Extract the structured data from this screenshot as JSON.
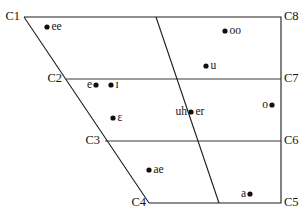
{
  "figure": {
    "name": "vowel-quadrilateral-diagram",
    "type": "diagram",
    "background_color": "#ffffff",
    "line_color": "#1c1c1c",
    "divider_color": "#3a3a3a",
    "dot_color": "#101010"
  },
  "corners": [
    {
      "id": "C1",
      "label": "C1",
      "x": 20,
      "y": 17,
      "anchor": "right"
    },
    {
      "id": "C8",
      "label": "C8",
      "x": 284,
      "y": 17,
      "anchor": "left"
    },
    {
      "id": "C2",
      "label": "C2",
      "x": 62,
      "y": 79,
      "anchor": "right"
    },
    {
      "id": "C7",
      "label": "C7",
      "x": 284,
      "y": 79,
      "anchor": "left"
    },
    {
      "id": "C3",
      "label": "C3",
      "x": 100,
      "y": 141,
      "anchor": "right"
    },
    {
      "id": "C6",
      "label": "C6",
      "x": 284,
      "y": 141,
      "anchor": "left"
    },
    {
      "id": "C4",
      "label": "C4",
      "x": 146,
      "y": 203,
      "anchor": "right"
    },
    {
      "id": "C5",
      "label": "C5",
      "x": 284,
      "y": 203,
      "anchor": "left"
    }
  ],
  "vowels": [
    {
      "label": "ee",
      "dot_x": 47,
      "dot_y": 27,
      "label_side": "right"
    },
    {
      "label": "oo",
      "dot_x": 225,
      "dot_y": 31,
      "label_side": "right"
    },
    {
      "label": "u",
      "dot_x": 206,
      "dot_y": 66,
      "label_side": "right"
    },
    {
      "label": "e",
      "dot_x": 96,
      "dot_y": 85,
      "label_side": "left"
    },
    {
      "label": "ɪ",
      "dot_x": 111,
      "dot_y": 85,
      "label_side": "right"
    },
    {
      "label": "o",
      "dot_x": 272,
      "dot_y": 105,
      "label_side": "left"
    },
    {
      "label": "uh",
      "dot_x": 191,
      "dot_y": 112,
      "label_side": "left"
    },
    {
      "label": "er",
      "dot_x": 191,
      "dot_y": 112,
      "label_side": "right"
    },
    {
      "label": "ɛ",
      "dot_x": 113,
      "dot_y": 118,
      "label_side": "right"
    },
    {
      "label": "ae",
      "dot_x": 149,
      "dot_y": 170,
      "label_side": "right"
    },
    {
      "label": "a",
      "dot_x": 250,
      "dot_y": 194,
      "label_side": "left"
    }
  ],
  "geometry": {
    "outline_points": "24,17 281,17 281,203 149,203",
    "divider_lines": [
      {
        "name": "line-c2-c7",
        "x1": 66,
        "y1": 79,
        "x2": 281,
        "y2": 79
      },
      {
        "name": "line-c3-c6",
        "x1": 105,
        "y1": 141,
        "x2": 281,
        "y2": 141
      }
    ],
    "diagonal_line": {
      "name": "front-back-divider",
      "x1": 156,
      "y1": 17,
      "x2": 219,
      "y2": 203
    }
  }
}
